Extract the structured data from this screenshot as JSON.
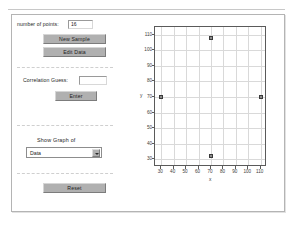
{
  "app": {
    "title": "Correlation Applet"
  },
  "controls": {
    "points_label": "number of points:",
    "points_value": "16",
    "points_placeholder": "",
    "new_sample_label": "New Sample",
    "edit_data_label": "Edit Data",
    "correlation_label": "Correlation Guess:",
    "correlation_value": "",
    "correlation_placeholder": "",
    "enter_label": "Enter",
    "show_graph_label": "Show Graph of",
    "graph_select_value": "Data",
    "graph_select_options": [
      "Data"
    ],
    "reset_label": "Reset"
  },
  "chart_data": {
    "type": "scatter",
    "title": "",
    "xlabel": "x",
    "ylabel": "y",
    "xlim": [
      25,
      115
    ],
    "ylim": [
      25,
      115
    ],
    "xticks": [
      30,
      40,
      50,
      60,
      70,
      80,
      90,
      100,
      110
    ],
    "yticks": [
      30,
      40,
      50,
      60,
      70,
      80,
      90,
      100,
      110
    ],
    "xtick_labels": [
      "30",
      "40",
      "50",
      "60",
      "70",
      "80",
      "90",
      "100",
      "110"
    ],
    "ytick_labels": [
      "30",
      "40",
      "50",
      "60",
      "70",
      "80",
      "90",
      "100",
      "110"
    ],
    "grid": true,
    "legend": null,
    "series": [
      {
        "name": "Data",
        "marker": "square",
        "color": "#8c8c8c",
        "points": [
          {
            "x": 70,
            "y": 108
          },
          {
            "x": 30,
            "y": 70
          },
          {
            "x": 110,
            "y": 70
          },
          {
            "x": 70,
            "y": 32
          }
        ]
      }
    ]
  }
}
